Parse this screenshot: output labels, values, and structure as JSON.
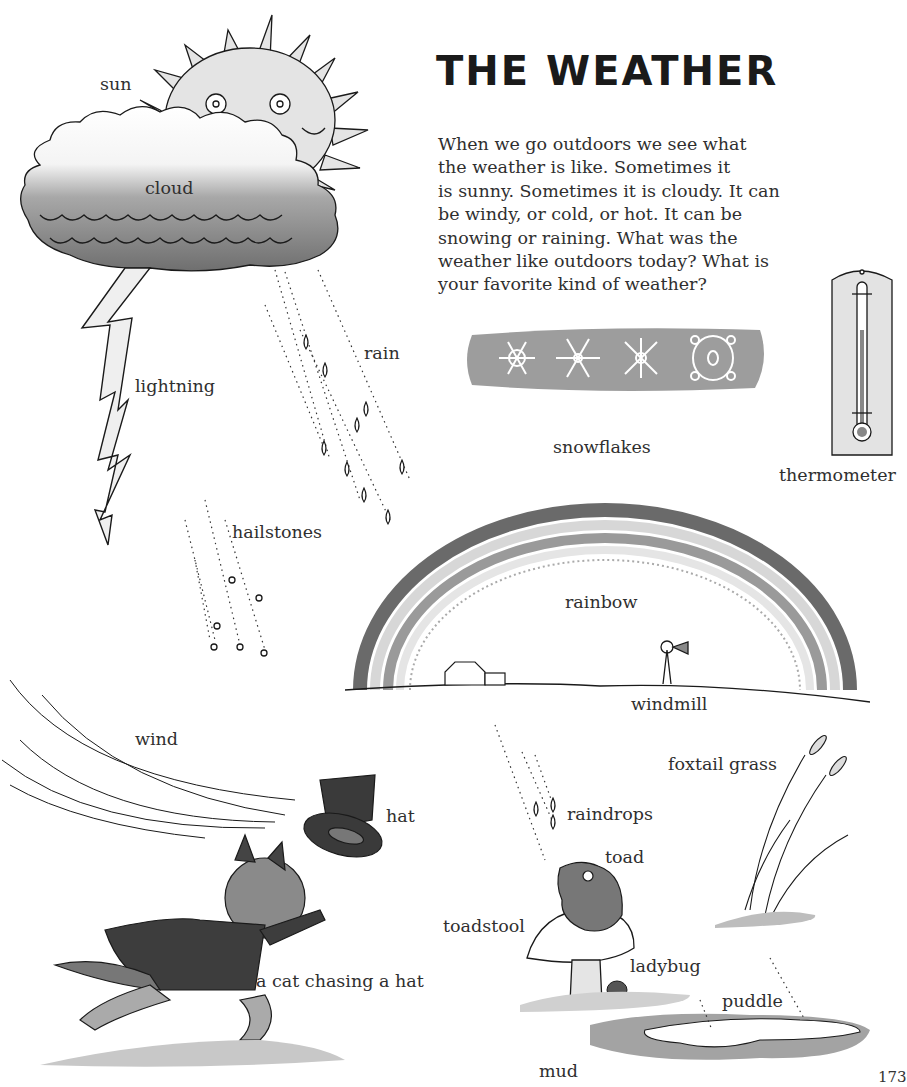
{
  "page": {
    "title": "THE WEATHER",
    "page_number": "173",
    "intro_lines": [
      "When we go outdoors we see what",
      "the weather is like. Sometimes it",
      "is sunny. Sometimes it is cloudy. It can",
      "be windy, or cold, or hot. It can be",
      "snowing or raining. What was the",
      "weather like outdoors today? What is",
      "your favorite kind of weather?"
    ]
  },
  "labels": {
    "sun": "sun",
    "cloud": "cloud",
    "lightning": "lightning",
    "rain": "rain",
    "hailstones": "hailstones",
    "snowflakes": "snowflakes",
    "thermometer": "thermometer",
    "rainbow": "rainbow",
    "windmill": "windmill",
    "wind": "wind",
    "hat": "hat",
    "cat": "a cat chasing a hat",
    "raindrops": "raindrops",
    "toad": "toad",
    "foxtail_grass": "foxtail grass",
    "toadstool": "toadstool",
    "ladybug": "ladybug",
    "puddle": "puddle",
    "mud": "mud"
  },
  "thermometer_scale": {
    "left": [
      "100",
      "60",
      "20",
      "20"
    ],
    "right": [
      "120",
      "80",
      "40",
      "0",
      "40"
    ]
  },
  "colors": {
    "ink": "#1a1a1a",
    "wash_light": "#d6d6d6",
    "wash_mid": "#9a9a9a",
    "wash_dark": "#5a5a5a"
  }
}
